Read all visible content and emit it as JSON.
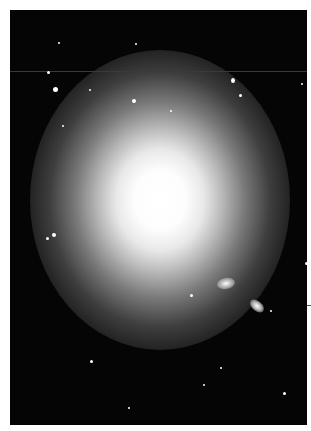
{
  "image": {
    "subject": "giant elliptical galaxy with surrounding stars and two small companion galaxies",
    "background": "#050505",
    "frame_color": "#ffffff"
  }
}
